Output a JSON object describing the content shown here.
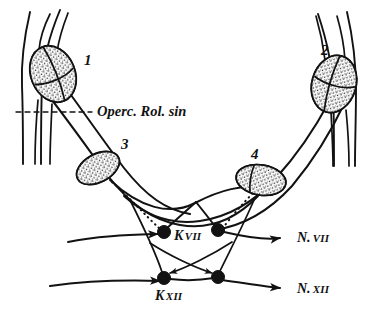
{
  "figure": {
    "title": "Operc. Rol. sin",
    "background_color": "#ffffff",
    "ink_color": "#121212",
    "caption_label": "Operc. Rol. sin"
  },
  "nuclei": [
    {
      "id": "nucleus-1",
      "number": "1",
      "label_x": 84,
      "label_y": 65,
      "cx": 53,
      "cy": 74,
      "rx": 22,
      "ry": 29,
      "rotate": -22
    },
    {
      "id": "nucleus-2",
      "number": "2",
      "label_x": 321,
      "label_y": 55,
      "cx": 334,
      "cy": 84,
      "rx": 22,
      "ry": 29,
      "rotate": 16
    },
    {
      "id": "nucleus-3",
      "number": "3",
      "label_x": 121,
      "label_y": 149,
      "cx": 98,
      "cy": 168,
      "rx": 23,
      "ry": 14,
      "rotate": -28
    },
    {
      "id": "nucleus-4",
      "number": "4",
      "label_x": 251,
      "label_y": 159,
      "cx": 261,
      "cy": 180,
      "rx": 25,
      "ry": 15,
      "rotate": 9
    }
  ],
  "nodes": [
    {
      "id": "node-k7-left",
      "cx": 164,
      "cy": 232,
      "r": 6.5
    },
    {
      "id": "node-k7-right",
      "cx": 218,
      "cy": 230,
      "r": 6.5
    },
    {
      "id": "node-k12-left",
      "cx": 164,
      "cy": 278,
      "r": 6.5
    },
    {
      "id": "node-k12-right",
      "cx": 218,
      "cy": 277,
      "r": 6.5
    }
  ],
  "labels": {
    "operculum": "Operc. Rol. sin",
    "k7": {
      "prefix": "K",
      "roman": "VII"
    },
    "k12": {
      "prefix": "K",
      "roman": "XII"
    },
    "n7": {
      "prefix": "N.",
      "roman": "VII"
    },
    "n12": {
      "prefix": "N.",
      "roman": "XII"
    }
  },
  "label_positions": {
    "operculum": {
      "x": 97,
      "y": 116
    },
    "k7": {
      "x": 174,
      "y": 240
    },
    "k12": {
      "x": 155,
      "y": 300
    },
    "n7": {
      "x": 297,
      "y": 242
    },
    "n12": {
      "x": 297,
      "y": 293
    }
  },
  "arrows": [
    {
      "id": "arrow-n7-right",
      "direction": "right",
      "x": 282,
      "y": 236
    },
    {
      "id": "arrow-n12-right",
      "direction": "right",
      "x": 282,
      "y": 288
    },
    {
      "id": "arrow-out-left-upper",
      "direction": "left",
      "x": 33,
      "y": 240
    },
    {
      "id": "arrow-out-left-lower",
      "direction": "left",
      "x": 33,
      "y": 285
    }
  ]
}
